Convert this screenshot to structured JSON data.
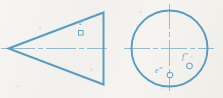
{
  "drawing": {
    "title": "Orthographic views of a cone with located points",
    "medium": "blue ink on off-white paper",
    "ink_color": "#4a93bf",
    "center_line_color": "#8fb9cf",
    "paper_color": "#f4f3ef",
    "views": [
      {
        "name": "front-view",
        "shape": "triangle",
        "description": "Isosceles triangle pointing left, representing the front view of a cone",
        "apex": {
          "x": 8,
          "y": 48
        },
        "top_vertex": {
          "x": 103,
          "y": 12
        },
        "bottom_vertex": {
          "x": 103,
          "y": 84
        },
        "center_line": {
          "from": {
            "x": 1,
            "y": 48
          },
          "to": {
            "x": 113,
            "y": 48
          }
        },
        "points": [
          {
            "label": "e′",
            "marker": "square",
            "x": 81,
            "y": 33,
            "label_x": 79,
            "label_y": 19
          }
        ]
      },
      {
        "name": "top-view",
        "shape": "circle",
        "description": "Circle representing the top view of the cone with quadrant center lines",
        "center": {
          "x": 169,
          "y": 48
        },
        "radius": 38,
        "horizontal_center_line": {
          "from": {
            "x": 124,
            "y": 48
          },
          "to": {
            "x": 216,
            "y": 48
          }
        },
        "vertical_center_line": {
          "from": {
            "x": 169,
            "y": 4
          },
          "to": {
            "x": 169,
            "y": 93
          }
        },
        "points": [
          {
            "label": "e″",
            "marker": "circle",
            "x": 170,
            "y": 75,
            "label_x": 157,
            "label_y": 69
          },
          {
            "label": "f″",
            "marker": "circle",
            "x": 189,
            "y": 66,
            "label_x": 183,
            "label_y": 53
          }
        ]
      }
    ]
  }
}
